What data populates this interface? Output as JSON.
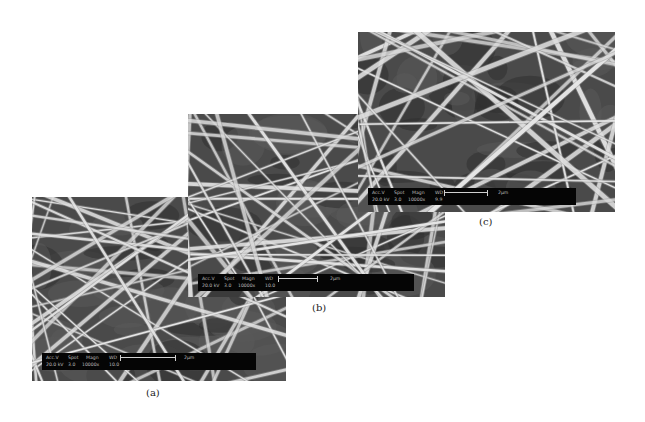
{
  "figure": {
    "panels": [
      {
        "id": "a",
        "caption": "(a)",
        "infobar": {
          "labels": [
            "Acc.V",
            "Spot",
            "Magn",
            "WD"
          ],
          "values": [
            "20.0 kV",
            "3.0",
            "10000x",
            "10.0"
          ],
          "scale_label": "2μm"
        },
        "seed": 11
      },
      {
        "id": "b",
        "caption": "(b)",
        "infobar": {
          "labels": [
            "Acc.V",
            "Spot",
            "Magn",
            "WD"
          ],
          "values": [
            "20.0 kV",
            "3.0",
            "10000x",
            "10.0"
          ],
          "scale_label": "2μm"
        },
        "seed": 29
      },
      {
        "id": "c",
        "caption": "(c)",
        "infobar": {
          "labels": [
            "Acc.V",
            "Spot",
            "Magn",
            "WD"
          ],
          "values": [
            "20.0 kV",
            "3.0",
            "10000x",
            "9.9"
          ],
          "scale_label": "2μm"
        },
        "seed": 47
      }
    ],
    "colors": {
      "background": "#4a4a4a",
      "fiber": "#e6e6e6",
      "infobar": "#050505",
      "infotext": "#bdbdbd"
    }
  }
}
